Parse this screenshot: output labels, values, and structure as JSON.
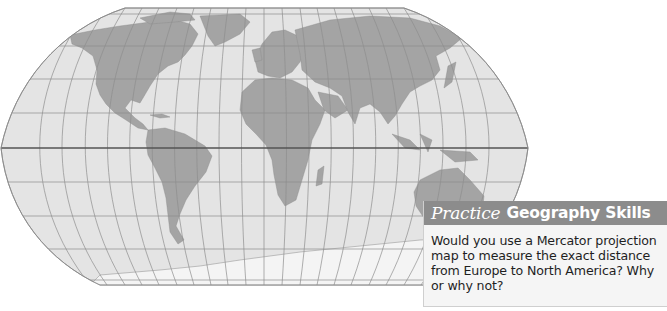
{
  "map": {
    "projection": "Robinson",
    "colors": {
      "ocean": "#e4e4e4",
      "land": "#a4a4a4",
      "graticule": "#8e8e8e",
      "equator": "#555555",
      "antarctica": "#f4f4f4",
      "outline": "#8a8a8a"
    },
    "features": [
      "North America",
      "South America",
      "Europe",
      "Africa",
      "Asia",
      "Australia",
      "Greenland",
      "Antarctica"
    ]
  },
  "practice": {
    "header_italic": "Practice",
    "header_bold": "Geography Skills",
    "question_lines": [
      "Would you use a Mercator projection",
      "map to measure the exact distance",
      "from Europe to North America? Why",
      "or why not?"
    ],
    "question": "Would you use a Mercator projection map to measure the exact distance from Europe to North America? Why or why not?"
  }
}
